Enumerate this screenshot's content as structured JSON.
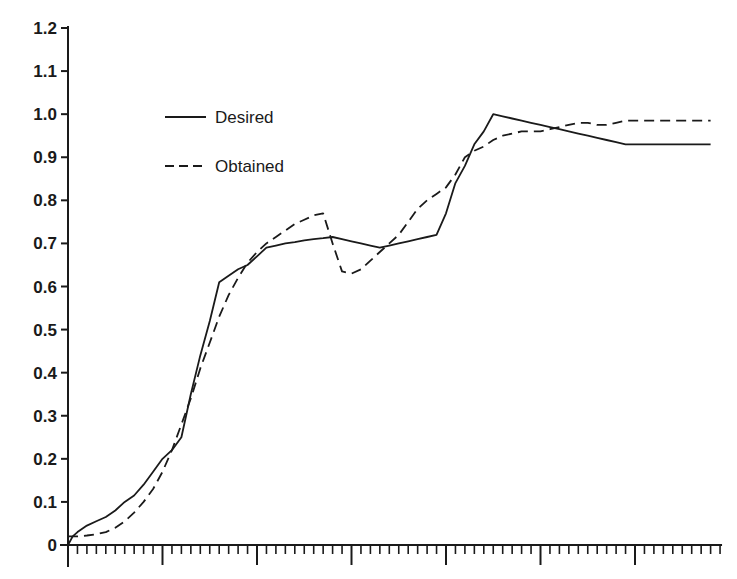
{
  "chart_data": {
    "type": "line",
    "title": "",
    "xlabel": "",
    "ylabel": "",
    "ylim": [
      0,
      1.2
    ],
    "xlim": [
      0,
      69
    ],
    "grid": false,
    "legend_position": "upper-left (inside plot)",
    "y_ticks": [
      "0",
      "0.1",
      "0.2",
      "0.3",
      "0.4",
      "0.5",
      "0.6",
      "0.7",
      "0.8",
      "0.9",
      "1.0",
      "1.1",
      "1.2"
    ],
    "x_ticks": {
      "labels_shown": false,
      "major_every": 10,
      "minor_every": 1,
      "count_minor": 69
    },
    "legend": [
      {
        "label": "Desired",
        "style": "solid"
      },
      {
        "label": "Obtained",
        "style": "dashed"
      }
    ],
    "series": [
      {
        "name": "Desired",
        "style": "solid",
        "color": "#1a1a1a",
        "x": [
          0,
          0.5,
          1,
          2,
          3,
          4,
          5,
          6,
          7,
          8,
          9,
          10,
          11,
          12,
          13,
          14,
          15,
          16,
          17,
          18,
          19,
          20,
          21,
          22,
          23,
          24,
          25,
          26,
          27,
          28,
          29,
          30,
          31,
          32,
          33,
          34,
          35,
          36,
          37,
          38,
          39,
          40,
          41,
          42,
          43,
          44,
          45,
          46,
          47,
          48,
          49,
          50,
          51,
          52,
          53,
          54,
          55,
          56,
          57,
          58,
          59,
          60,
          61,
          62,
          63,
          64,
          65,
          66,
          67,
          68
        ],
        "values": [
          0.0,
          0.02,
          0.03,
          0.045,
          0.055,
          0.065,
          0.08,
          0.1,
          0.115,
          0.14,
          0.17,
          0.2,
          0.22,
          0.25,
          0.35,
          0.44,
          0.52,
          0.61,
          0.625,
          0.64,
          0.65,
          0.67,
          0.69,
          0.695,
          0.7,
          0.703,
          0.707,
          0.71,
          0.712,
          0.715,
          0.71,
          0.705,
          0.7,
          0.695,
          0.69,
          0.695,
          0.7,
          0.705,
          0.71,
          0.715,
          0.72,
          0.77,
          0.84,
          0.88,
          0.93,
          0.96,
          1.0,
          0.995,
          0.99,
          0.985,
          0.98,
          0.975,
          0.97,
          0.965,
          0.96,
          0.955,
          0.95,
          0.945,
          0.94,
          0.935,
          0.93,
          0.93,
          0.93,
          0.93,
          0.93,
          0.93,
          0.93,
          0.93,
          0.93,
          0.93
        ]
      },
      {
        "name": "Obtained",
        "style": "dashed",
        "color": "#1a1a1a",
        "x": [
          0,
          1,
          2,
          3,
          4,
          5,
          6,
          7,
          8,
          9,
          10,
          11,
          12,
          13,
          14,
          15,
          16,
          17,
          18,
          19,
          20,
          21,
          22,
          23,
          24,
          25,
          26,
          27,
          28,
          29,
          30,
          31,
          32,
          33,
          34,
          35,
          36,
          37,
          38,
          39,
          40,
          41,
          42,
          43,
          44,
          45,
          46,
          47,
          48,
          49,
          50,
          51,
          52,
          53,
          54,
          55,
          56,
          57,
          58,
          59,
          60,
          61,
          62,
          63,
          64,
          65,
          66,
          67,
          68
        ],
        "values": [
          0.02,
          0.02,
          0.022,
          0.025,
          0.03,
          0.04,
          0.055,
          0.075,
          0.1,
          0.13,
          0.17,
          0.22,
          0.28,
          0.34,
          0.41,
          0.47,
          0.53,
          0.58,
          0.62,
          0.655,
          0.68,
          0.7,
          0.715,
          0.73,
          0.745,
          0.755,
          0.765,
          0.77,
          0.7,
          0.635,
          0.63,
          0.64,
          0.66,
          0.68,
          0.7,
          0.72,
          0.75,
          0.78,
          0.8,
          0.815,
          0.83,
          0.86,
          0.9,
          0.915,
          0.925,
          0.94,
          0.95,
          0.955,
          0.96,
          0.96,
          0.96,
          0.965,
          0.97,
          0.975,
          0.98,
          0.98,
          0.975,
          0.975,
          0.98,
          0.985,
          0.985,
          0.985,
          0.985,
          0.985,
          0.985,
          0.985,
          0.985,
          0.985,
          0.985
        ]
      }
    ]
  }
}
